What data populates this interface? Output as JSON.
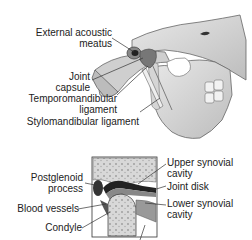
{
  "diagram": {
    "main_view": {
      "subject": "skull-lateral-tmj",
      "labels": [
        {
          "id": "external-acoustic-meatus",
          "lines": [
            "External acoustic",
            "meatus"
          ]
        },
        {
          "id": "joint-capsule",
          "lines": [
            "Joint",
            "capsule"
          ]
        },
        {
          "id": "temporomandibular-ligament",
          "lines": [
            "Temporomandibular",
            "ligament"
          ]
        },
        {
          "id": "stylomandibular-ligament",
          "lines": [
            "Stylomandibular ligament"
          ]
        }
      ]
    },
    "inset_view": {
      "subject": "tmj-cross-section",
      "labels": [
        {
          "id": "postglenoid-process",
          "lines": [
            "Postglenoid",
            "process"
          ]
        },
        {
          "id": "blood-vessels",
          "lines": [
            "Blood vessels"
          ]
        },
        {
          "id": "condyle",
          "lines": [
            "Condyle"
          ]
        },
        {
          "id": "upper-synovial-cavity",
          "lines": [
            "Upper synovial",
            "cavity"
          ]
        },
        {
          "id": "joint-disk",
          "lines": [
            "Joint disk"
          ]
        },
        {
          "id": "lower-synovial-cavity",
          "lines": [
            "Lower synovial",
            "cavity"
          ]
        }
      ]
    }
  }
}
